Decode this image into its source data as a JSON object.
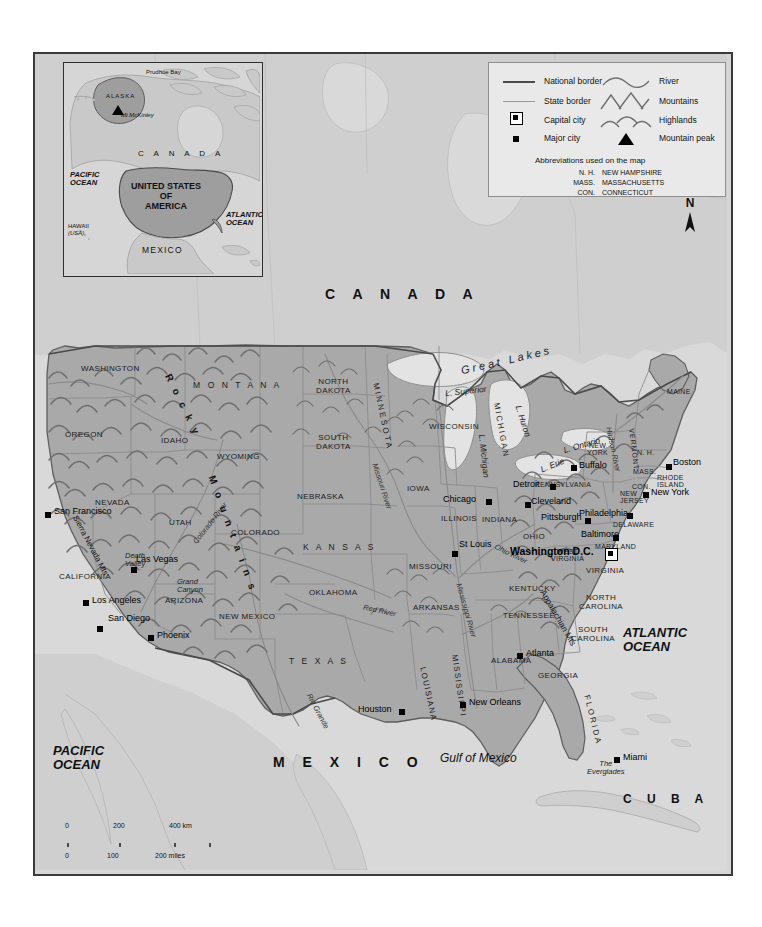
{
  "legend": {
    "items": [
      {
        "symbol": "line-national",
        "label": "National border"
      },
      {
        "symbol": "line-state",
        "label": "State border"
      },
      {
        "symbol": "square-outline",
        "label": "Capital city"
      },
      {
        "symbol": "square-filled",
        "label": "Major city"
      },
      {
        "symbol": "river-curve",
        "label": "River"
      },
      {
        "symbol": "mountains-glyph",
        "label": "Mountains"
      },
      {
        "symbol": "highlands-glyph",
        "label": "Highlands"
      },
      {
        "symbol": "triangle",
        "label": "Mountain peak"
      }
    ],
    "abbrev_title": "Abbreviations used on the map",
    "abbreviations": [
      {
        "short": "N. H.",
        "full": "NEW HAMPSHIRE"
      },
      {
        "short": "MASS.",
        "full": "MASSACHUSETTS"
      },
      {
        "short": "CON.",
        "full": "CONNECTICUT"
      }
    ]
  },
  "inset": {
    "countries": [
      "C A N A D A"
    ],
    "us_label": "UNITED STATES\nOF\nAMERICA",
    "us_line1": "UNITED STATES",
    "us_line2": "OF",
    "us_line3": "AMERICA",
    "mexico": "MEXICO",
    "pacific": "PACIFIC\nOCEAN",
    "pacific_l1": "PACIFIC",
    "pacific_l2": "OCEAN",
    "atlantic_l1": "ATLANTIC",
    "atlantic_l2": "OCEAN",
    "alaska": "ALASKA",
    "prudhoe": "Prudhoe Bay",
    "mckinley": "Mt.McKinley",
    "hawaii_l1": "HAWAII",
    "hawaii_l2": "(USA)"
  },
  "compass": {
    "north": "N"
  },
  "scale": {
    "km_ticks": [
      "0",
      "200",
      "400 km"
    ],
    "miles_ticks": [
      "0",
      "100",
      "200 miles"
    ]
  },
  "countries": [
    {
      "name": "C A N A D A",
      "x": 290,
      "y": 240
    },
    {
      "name": "M E X I C O",
      "x": 238,
      "y": 706
    },
    {
      "name": "C U B A",
      "x": 590,
      "y": 745
    }
  ],
  "oceans": [
    {
      "l1": "PACIFIC",
      "l2": "OCEAN",
      "x": 22,
      "y": 695
    },
    {
      "l1": "ATLANTIC",
      "l2": "OCEAN",
      "x": 592,
      "y": 580
    },
    {
      "l1": "Gulf of Mexico",
      "l2": "",
      "x": 412,
      "y": 703
    }
  ],
  "states": [
    {
      "name": "WASHINGTON",
      "x": 48,
      "y": 315
    },
    {
      "name": "OREGON",
      "x": 32,
      "y": 380
    },
    {
      "name": "IDAHO",
      "x": 128,
      "y": 385
    },
    {
      "name": "M O N T A N A",
      "x": 160,
      "y": 330
    },
    {
      "name": "WYOMING",
      "x": 185,
      "y": 401
    },
    {
      "name": "NEVADA",
      "x": 62,
      "y": 448
    },
    {
      "name": "UTAH",
      "x": 136,
      "y": 468
    },
    {
      "name": "CALIFORNIA",
      "x": 27,
      "y": 521
    },
    {
      "name": "ARIZONA",
      "x": 132,
      "y": 545
    },
    {
      "name": "NEW MEXICO",
      "x": 187,
      "y": 562
    },
    {
      "name": "COLORADO",
      "x": 198,
      "y": 477
    },
    {
      "name": "NORTH\nDAKOTA",
      "x": 283,
      "y": 330
    },
    {
      "name": "SOUTH\nDAKOTA",
      "x": 283,
      "y": 385
    },
    {
      "name": "NEBRASKA",
      "x": 266,
      "y": 441
    },
    {
      "name": "K A N S A S",
      "x": 272,
      "y": 492
    },
    {
      "name": "OKLAHOMA",
      "x": 277,
      "y": 538
    },
    {
      "name": "T E X A S",
      "x": 258,
      "y": 606
    },
    {
      "name": "MINNESOTA",
      "x": 347,
      "y": 335
    },
    {
      "name": "IOWA",
      "x": 374,
      "y": 434
    },
    {
      "name": "MISSOURI",
      "x": 378,
      "y": 512
    },
    {
      "name": "ARKANSAS",
      "x": 382,
      "y": 553
    },
    {
      "name": "LOUISIANA",
      "x": 396,
      "y": 620
    },
    {
      "name": "MISSISSIPPI",
      "x": 428,
      "y": 610
    },
    {
      "name": "ALABAMA",
      "x": 460,
      "y": 605
    },
    {
      "name": "WISCONSIN",
      "x": 398,
      "y": 372
    },
    {
      "name": "MICHIGAN",
      "x": 468,
      "y": 355
    },
    {
      "name": "ILLINOIS",
      "x": 410,
      "y": 463
    },
    {
      "name": "INDIANA",
      "x": 450,
      "y": 465
    },
    {
      "name": "OHIO",
      "x": 490,
      "y": 481
    },
    {
      "name": "KENTUCKY",
      "x": 478,
      "y": 533
    },
    {
      "name": "TENNESSEE",
      "x": 472,
      "y": 560
    },
    {
      "name": "GEORGIA",
      "x": 506,
      "y": 620
    },
    {
      "name": "FLORIDA",
      "x": 558,
      "y": 650
    },
    {
      "name": "SOUTH\nCAROLINA",
      "x": 540,
      "y": 577
    },
    {
      "name": "NORTH\nCAROLINA",
      "x": 548,
      "y": 545
    },
    {
      "name": "VIRGINIA",
      "x": 555,
      "y": 516
    },
    {
      "name": "WEST\nVIRGINIA",
      "x": 522,
      "y": 499
    },
    {
      "name": "PENNSYLVANIA",
      "x": 508,
      "y": 430
    },
    {
      "name": "NEW\nYORK",
      "x": 555,
      "y": 392
    },
    {
      "name": "MARYLAND",
      "x": 564,
      "y": 492
    },
    {
      "name": "DELAWARE",
      "x": 582,
      "y": 470
    },
    {
      "name": "NEW\nJERSEY",
      "x": 588,
      "y": 440
    },
    {
      "name": "VERMONT",
      "x": 602,
      "y": 382
    },
    {
      "name": "MAINE",
      "x": 636,
      "y": 338
    },
    {
      "name": "N. H.",
      "x": 605,
      "y": 398
    },
    {
      "name": "MASS.",
      "x": 601,
      "y": 417
    },
    {
      "name": "CON.",
      "x": 600,
      "y": 432
    },
    {
      "name": "RHODE\nISLAND",
      "x": 625,
      "y": 424
    }
  ],
  "cities": [
    {
      "name": "San Francisco",
      "x": 16,
      "y": 455,
      "capital": false
    },
    {
      "name": "Las Vegas",
      "x": 101,
      "y": 503,
      "capital": false
    },
    {
      "name": "Los Angeles",
      "x": 57,
      "y": 543,
      "capital": false
    },
    {
      "name": "San Diego",
      "x": 76,
      "y": 562,
      "capital": false
    },
    {
      "name": "Phoenix",
      "x": 124,
      "y": 578,
      "capital": false
    },
    {
      "name": "Houston",
      "x": 323,
      "y": 653,
      "capital": false
    },
    {
      "name": "New Orleans",
      "x": 428,
      "y": 645,
      "capital": false
    },
    {
      "name": "Atlanta",
      "x": 491,
      "y": 596,
      "capital": false
    },
    {
      "name": "Miami",
      "x": 586,
      "y": 700,
      "capital": false
    },
    {
      "name": "St Louis",
      "x": 424,
      "y": 488,
      "capital": false
    },
    {
      "name": "Chicago",
      "x": 412,
      "y": 443,
      "capital": false
    },
    {
      "name": "Detroit",
      "x": 481,
      "y": 428,
      "capital": false
    },
    {
      "name": "Cleveland",
      "x": 498,
      "y": 445,
      "capital": false
    },
    {
      "name": "Pittsburgh",
      "x": 510,
      "y": 461,
      "capital": false
    },
    {
      "name": "Buffalo",
      "x": 544,
      "y": 409,
      "capital": false
    },
    {
      "name": "Boston",
      "x": 640,
      "y": 406,
      "capital": false
    },
    {
      "name": "New York",
      "x": 616,
      "y": 436,
      "capital": false
    },
    {
      "name": "Philadelphia",
      "x": 548,
      "y": 457,
      "capital": false
    },
    {
      "name": "Baltimore",
      "x": 550,
      "y": 478,
      "capital": false
    },
    {
      "name": "Washington D.C.",
      "x": 508,
      "y": 494,
      "capital": true
    }
  ],
  "water_features": [
    {
      "name": "Great Lakes",
      "x": 432,
      "y": 310
    },
    {
      "name": "L. Superior",
      "x": 420,
      "y": 338
    },
    {
      "name": "L. Huron",
      "x": 492,
      "y": 360
    },
    {
      "name": "L. Michigan",
      "x": 455,
      "y": 392
    },
    {
      "name": "L. Erie",
      "x": 512,
      "y": 412
    },
    {
      "name": "L. Ontario",
      "x": 537,
      "y": 390
    },
    {
      "name": "Missouri River",
      "x": 352,
      "y": 415
    },
    {
      "name": "Mississippi River",
      "x": 435,
      "y": 540
    },
    {
      "name": "Ohio River",
      "x": 470,
      "y": 495
    },
    {
      "name": "Colorado River",
      "x": 165,
      "y": 495
    },
    {
      "name": "Red River",
      "x": 335,
      "y": 560
    },
    {
      "name": "Rio Grande",
      "x": 285,
      "y": 645
    },
    {
      "name": "Hudson River",
      "x": 584,
      "y": 385
    }
  ],
  "terrain": [
    {
      "name": "R o c k y",
      "x": 140,
      "y": 325
    },
    {
      "name": "M o u n t a i n s",
      "x": 183,
      "y": 430
    },
    {
      "name": "Sierra Nevada Mts",
      "x": 48,
      "y": 470
    },
    {
      "name": "Appalachian Mts",
      "x": 520,
      "y": 545
    },
    {
      "name": "Death Valley",
      "x": 93,
      "y": 505
    },
    {
      "name": "Grand Canyon",
      "x": 145,
      "y": 530
    },
    {
      "name": "The Everglades",
      "x": 560,
      "y": 712
    }
  ],
  "colors": {
    "us_land": "#a9a9a9",
    "neighbor_land": "#cfcfcf",
    "ocean": "#d9d9d9",
    "frame": "#3a3a3a",
    "border_national": "#4a4a4a",
    "border_state": "#9a9a9a",
    "legend_bg": "#e9e9e9"
  }
}
